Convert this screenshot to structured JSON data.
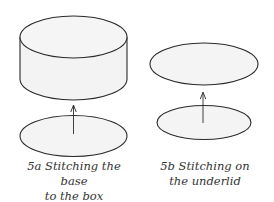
{
  "figures": [
    {
      "id": "5a",
      "caption_line1": "5a Stitching the base",
      "caption_line2": "to the box",
      "parts": [
        "cylinder-box",
        "base-ellipse",
        "up-arrow"
      ]
    },
    {
      "id": "5b",
      "caption_line1": "5b Stitching on",
      "caption_line2": "the underlid",
      "parts": [
        "lid-ellipse",
        "underlid-ellipse",
        "up-arrow"
      ]
    }
  ],
  "colors": {
    "stroke": "#2a2a2a",
    "fill": "#f4f4f4",
    "text": "#333333"
  }
}
